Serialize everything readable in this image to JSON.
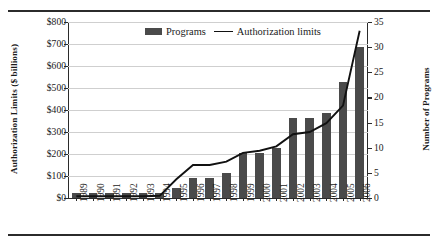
{
  "figure": {
    "legend": {
      "items": [
        {
          "label": "Programs",
          "marker": "bar-swatch",
          "color": "#4a4a4a"
        },
        {
          "label": "Authorization limits",
          "marker": "line-swatch",
          "color": "#111111"
        }
      ]
    },
    "axes": {
      "left_title": "Authorization Limits ($ billions)",
      "right_title": "Number of Programs",
      "left_ticks": [
        "$0",
        "$100",
        "$200",
        "$300",
        "$400",
        "$500",
        "$600",
        "$700",
        "$800"
      ],
      "right_ticks": [
        "0",
        "5",
        "10",
        "15",
        "20",
        "25",
        "30",
        "35"
      ]
    }
  },
  "chart_data": {
    "type": "bar",
    "title": "",
    "xlabel": "",
    "ylabel": "Authorization Limits ($ billions)",
    "y2label": "Number of Programs",
    "ylim": [
      0,
      800
    ],
    "y2lim": [
      0,
      35
    ],
    "grid": true,
    "legend_position": "top-center",
    "categories": [
      "1989",
      "1990",
      "1991",
      "1992",
      "1993",
      "1994",
      "1995",
      "1996",
      "1997",
      "1998",
      "1999",
      "2000",
      "2001",
      "2002",
      "2003",
      "2004",
      "2005",
      "2006"
    ],
    "series": [
      {
        "name": "Programs",
        "type": "bar",
        "axis": "right",
        "unit": "count",
        "color": "#4a4a4a",
        "values": [
          1,
          1,
          1,
          1,
          1,
          1,
          2,
          4,
          4,
          5,
          9,
          9,
          10,
          16,
          16,
          17,
          23,
          30
        ]
      },
      {
        "name": "Authorization limits",
        "type": "line",
        "axis": "left",
        "unit": "$ billions",
        "color": "#111111",
        "values": [
          8,
          8,
          8,
          8,
          8,
          10,
          85,
          150,
          150,
          165,
          205,
          215,
          235,
          290,
          300,
          340,
          420,
          760
        ]
      }
    ]
  }
}
